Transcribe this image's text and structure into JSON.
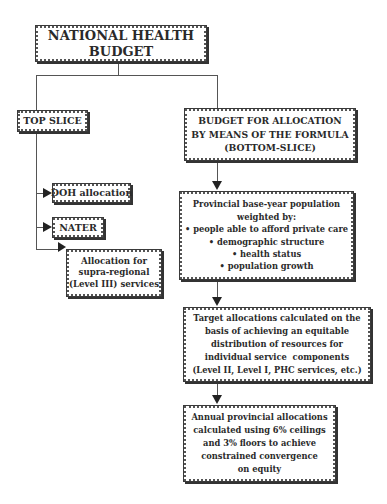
{
  "diagram": {
    "root": {
      "lines": [
        "NATIONAL HEALTH",
        "BUDGET"
      ]
    },
    "top_slice": {
      "label": "TOP SLICE",
      "children": [
        {
          "lines": [
            "DOH allocation"
          ]
        },
        {
          "lines": [
            "NATER"
          ]
        },
        {
          "lines": [
            "Allocation for",
            "supra-regional",
            "(Level III) services"
          ]
        }
      ]
    },
    "bottom_slice": {
      "lines": [
        "BUDGET FOR ALLOCATION",
        "BY MEANS OF THE FORMULA",
        "(BOTTOM-SLICE)"
      ]
    },
    "flow": [
      {
        "lines": [
          "Provincial base-year population",
          "weighted by:",
          "• people able to afford private care",
          "• demographic structure",
          "• health status",
          "• population growth"
        ]
      },
      {
        "lines": [
          "Target allocations calculated on the",
          "basis of achieving an equitable",
          "distribution of resources for",
          "individual service  components",
          "(Level II, Level I, PHC services, etc.)"
        ]
      },
      {
        "lines": [
          "Annual provincial allocations",
          "calculated using 6% ceilings",
          "and 3% floors to achieve",
          "constrained convergence",
          "on equity"
        ]
      }
    ]
  }
}
